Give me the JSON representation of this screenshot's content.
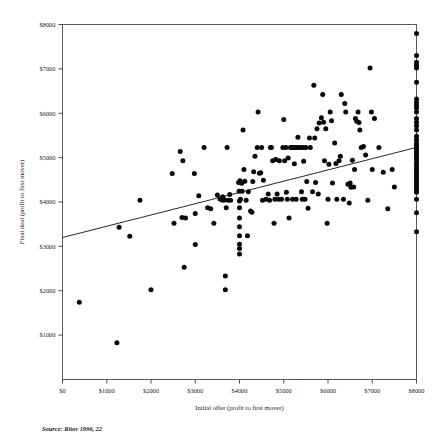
{
  "chart_data": {
    "type": "scatter",
    "title": "",
    "xlabel": "Initial offer (profit to first mover)",
    "ylabel": "Final deal (profit to first mover)",
    "xlim": [
      0,
      8000
    ],
    "ylim": [
      0,
      8000
    ],
    "grid": false,
    "legend": null,
    "x_tick_labels": [
      "$0",
      "$1000",
      "$2000",
      "$3000",
      "$4000",
      "$5000",
      "$6000",
      "$7000",
      "$8000"
    ],
    "x_tick_values": [
      0,
      1000,
      2000,
      3000,
      4000,
      5000,
      6000,
      7000,
      8000
    ],
    "y_tick_labels": [
      "$1000",
      "$2000",
      "$3000",
      "$4000",
      "$5000",
      "$6000",
      "$7000",
      "$8000"
    ],
    "y_tick_values": [
      1000,
      2000,
      3000,
      4000,
      5000,
      6000,
      7000,
      8000
    ],
    "marker": "filled-circle",
    "marker_color": "#080808",
    "trendline": {
      "label": "linear fit",
      "color": "#111111",
      "x_start": 0,
      "y_start": 3200,
      "x_end": 8000,
      "y_end": 5230
    },
    "points": [
      [
        380,
        1740
      ],
      [
        1230,
        830
      ],
      [
        1280,
        3430
      ],
      [
        1520,
        3230
      ],
      [
        1750,
        4040
      ],
      [
        2000,
        2020
      ],
      [
        2480,
        4640
      ],
      [
        2520,
        3520
      ],
      [
        2660,
        5140
      ],
      [
        2700,
        3650
      ],
      [
        2720,
        4930
      ],
      [
        2750,
        2530
      ],
      [
        2780,
        3640
      ],
      [
        2980,
        4640
      ],
      [
        3000,
        3740
      ],
      [
        3000,
        3040
      ],
      [
        3080,
        4140
      ],
      [
        3200,
        5230
      ],
      [
        3280,
        3870
      ],
      [
        3350,
        3850
      ],
      [
        3420,
        3520
      ],
      [
        3500,
        4160
      ],
      [
        3560,
        4070
      ],
      [
        3600,
        4050
      ],
      [
        3620,
        4120
      ],
      [
        3640,
        4040
      ],
      [
        3660,
        4050
      ],
      [
        3680,
        2330
      ],
      [
        3680,
        2020
      ],
      [
        3700,
        3870
      ],
      [
        3720,
        5230
      ],
      [
        3740,
        4040
      ],
      [
        3780,
        4170
      ],
      [
        3800,
        4040
      ],
      [
        3980,
        4440
      ],
      [
        3990,
        4240
      ],
      [
        4000,
        4020
      ],
      [
        4000,
        3870
      ],
      [
        4000,
        3640
      ],
      [
        4000,
        3440
      ],
      [
        4000,
        3240
      ],
      [
        4000,
        3050
      ],
      [
        4000,
        2950
      ],
      [
        4000,
        2830
      ],
      [
        4010,
        4480
      ],
      [
        4020,
        4060
      ],
      [
        4050,
        4420
      ],
      [
        4060,
        4240
      ],
      [
        4080,
        5620
      ],
      [
        4100,
        4730
      ],
      [
        4120,
        4470
      ],
      [
        4150,
        4040
      ],
      [
        4180,
        3240
      ],
      [
        4200,
        4230
      ],
      [
        4250,
        3800
      ],
      [
        4280,
        3770
      ],
      [
        4300,
        4460
      ],
      [
        4320,
        4680
      ],
      [
        4350,
        5030
      ],
      [
        4400,
        5230
      ],
      [
        4420,
        6030
      ],
      [
        4450,
        4650
      ],
      [
        4480,
        4660
      ],
      [
        4500,
        5230
      ],
      [
        4520,
        4040
      ],
      [
        4540,
        4490
      ],
      [
        4600,
        4060
      ],
      [
        4650,
        4180
      ],
      [
        4680,
        4040
      ],
      [
        4700,
        5230
      ],
      [
        4720,
        5230
      ],
      [
        4750,
        4930
      ],
      [
        4780,
        3520
      ],
      [
        4800,
        4060
      ],
      [
        4820,
        4960
      ],
      [
        4850,
        4180
      ],
      [
        4880,
        4060
      ],
      [
        4900,
        4930
      ],
      [
        4950,
        4060
      ],
      [
        4980,
        5230
      ],
      [
        5000,
        5860
      ],
      [
        5020,
        4930
      ],
      [
        5050,
        5230
      ],
      [
        5060,
        4220
      ],
      [
        5080,
        4060
      ],
      [
        5100,
        4990
      ],
      [
        5120,
        3640
      ],
      [
        5150,
        5230
      ],
      [
        5180,
        5230
      ],
      [
        5200,
        4060
      ],
      [
        5220,
        5230
      ],
      [
        5240,
        4860
      ],
      [
        5250,
        5230
      ],
      [
        5280,
        4060
      ],
      [
        5300,
        5230
      ],
      [
        5320,
        5460
      ],
      [
        5350,
        5230
      ],
      [
        5380,
        5230
      ],
      [
        5400,
        4230
      ],
      [
        5420,
        4060
      ],
      [
        5440,
        5230
      ],
      [
        5450,
        4920
      ],
      [
        5480,
        4060
      ],
      [
        5500,
        5230
      ],
      [
        5520,
        4460
      ],
      [
        5550,
        3860
      ],
      [
        5580,
        5440
      ],
      [
        5600,
        5230
      ],
      [
        5650,
        4230
      ],
      [
        5680,
        6630
      ],
      [
        5700,
        5440
      ],
      [
        5720,
        4440
      ],
      [
        5750,
        5650
      ],
      [
        5780,
        4180
      ],
      [
        5800,
        5780
      ],
      [
        5850,
        5900
      ],
      [
        5880,
        6420
      ],
      [
        5900,
        5800
      ],
      [
        5920,
        4930
      ],
      [
        5950,
        5650
      ],
      [
        5980,
        3520
      ],
      [
        6000,
        4060
      ],
      [
        6020,
        4850
      ],
      [
        6050,
        6030
      ],
      [
        6080,
        5830
      ],
      [
        6100,
        4430
      ],
      [
        6150,
        5330
      ],
      [
        6180,
        4870
      ],
      [
        6200,
        4060
      ],
      [
        6250,
        4930
      ],
      [
        6280,
        5030
      ],
      [
        6300,
        6420
      ],
      [
        6350,
        4060
      ],
      [
        6380,
        6220
      ],
      [
        6400,
        6030
      ],
      [
        6450,
        4400
      ],
      [
        6480,
        3980
      ],
      [
        6500,
        4430
      ],
      [
        6520,
        4330
      ],
      [
        6550,
        4940
      ],
      [
        6580,
        4340
      ],
      [
        6600,
        4730
      ],
      [
        6620,
        5880
      ],
      [
        6650,
        5820
      ],
      [
        6680,
        6030
      ],
      [
        6700,
        5790
      ],
      [
        6720,
        5620
      ],
      [
        6750,
        5230
      ],
      [
        6800,
        5250
      ],
      [
        6850,
        5060
      ],
      [
        6900,
        4040
      ],
      [
        6950,
        7020
      ],
      [
        6980,
        6030
      ],
      [
        7000,
        4730
      ],
      [
        7050,
        5880
      ],
      [
        7150,
        5230
      ],
      [
        7250,
        4670
      ],
      [
        7350,
        3850
      ],
      [
        7450,
        4730
      ],
      [
        7500,
        4340
      ],
      [
        8000,
        7800
      ],
      [
        8000,
        7300
      ],
      [
        8000,
        7150
      ],
      [
        8000,
        7080
      ],
      [
        8000,
        7020
      ],
      [
        8000,
        6700
      ],
      [
        8000,
        6320
      ],
      [
        8000,
        6250
      ],
      [
        8000,
        6180
      ],
      [
        8000,
        6120
      ],
      [
        8000,
        6030
      ],
      [
        8000,
        5880
      ],
      [
        8000,
        5800
      ],
      [
        8000,
        5720
      ],
      [
        8000,
        5620
      ],
      [
        8000,
        5480
      ],
      [
        8000,
        5400
      ],
      [
        8000,
        5330
      ],
      [
        8000,
        5280
      ],
      [
        8000,
        5230
      ],
      [
        8000,
        5180
      ],
      [
        8000,
        5120
      ],
      [
        8000,
        5060
      ],
      [
        8000,
        5000
      ],
      [
        8000,
        4950
      ],
      [
        8000,
        4880
      ],
      [
        8000,
        4820
      ],
      [
        8000,
        4760
      ],
      [
        8000,
        4700
      ],
      [
        8000,
        4640
      ],
      [
        8000,
        4580
      ],
      [
        8000,
        4520
      ],
      [
        8000,
        4460
      ],
      [
        8000,
        4400
      ],
      [
        8000,
        4340
      ],
      [
        8000,
        4280
      ],
      [
        8000,
        4220
      ],
      [
        8000,
        4060
      ],
      [
        8000,
        3760
      ],
      [
        8000,
        3330
      ]
    ]
  },
  "source_note": "Source: Ritov 1996, 22"
}
